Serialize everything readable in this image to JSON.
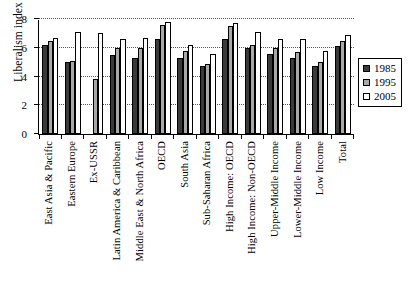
{
  "chart_data": {
    "type": "bar",
    "title": "",
    "subtitle": "",
    "xlabel": "",
    "ylabel": "Liberalism index",
    "ylim": [
      0,
      8
    ],
    "yticks": [
      0,
      2,
      4,
      6,
      8
    ],
    "ytick_labels": [
      "0",
      "2",
      "4",
      "6",
      "8"
    ],
    "grid": "horizontal-dotted",
    "legend_position": "right",
    "categories": [
      "East Asia & Pacific",
      "Eastern Europe",
      "Ex-USSR",
      "Latin America & Caribbean",
      "Middle East & North Africa",
      "OECD",
      "South Asia",
      "Sub-Saharan Africa",
      "High Income: OECD",
      "High Income: Non-OECD",
      "Upper-Middle Income",
      "Lower-Middle Income",
      "Low Income",
      "Total"
    ],
    "series": [
      {
        "name": "1985",
        "color": "#3a3a3a",
        "values": [
          6.2,
          5.0,
          null,
          5.5,
          5.3,
          6.6,
          5.3,
          4.7,
          6.6,
          6.0,
          5.6,
          5.3,
          4.7,
          6.1
        ]
      },
      {
        "name": "1995",
        "color": "#a8a8a8",
        "values": [
          6.5,
          5.1,
          3.8,
          6.0,
          6.0,
          7.6,
          5.8,
          4.9,
          7.5,
          6.2,
          6.0,
          5.7,
          5.0,
          6.5
        ]
      },
      {
        "name": "2005",
        "color": "#ffffff",
        "values": [
          6.7,
          7.1,
          7.0,
          6.6,
          6.7,
          7.8,
          6.2,
          5.6,
          7.7,
          7.1,
          6.6,
          6.6,
          5.8,
          6.9
        ]
      }
    ]
  },
  "legend": {
    "items": [
      {
        "label": "1985"
      },
      {
        "label": "1995"
      },
      {
        "label": "2005"
      }
    ]
  }
}
